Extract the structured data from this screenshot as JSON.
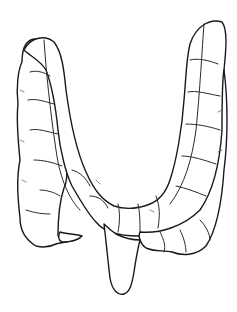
{
  "illustration": {
    "subject": "large-intestine-line-drawing",
    "background_color": "#ffffff",
    "ink_color": "#1a1a1a"
  }
}
